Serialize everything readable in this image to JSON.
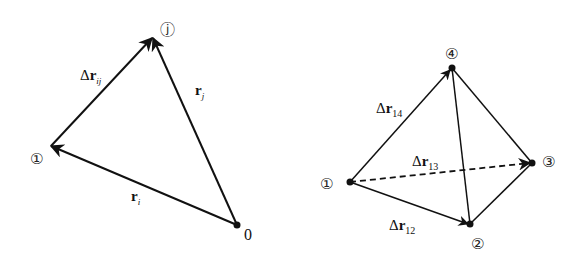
{
  "left_diagram": {
    "nodes": {
      "i": {
        "label": "①",
        "x": 38,
        "y": 163
      },
      "j": {
        "label": "ⓙ",
        "x": 167,
        "y": 34
      },
      "origin": {
        "label": "0",
        "x": 248,
        "y": 238
      }
    },
    "vectors": {
      "r_ij": {
        "prefix": "Δ",
        "main": "r",
        "sub": "ij"
      },
      "r_j": {
        "main": "r",
        "sub": "j"
      },
      "r_i": {
        "main": "r",
        "sub": "i"
      }
    }
  },
  "right_diagram": {
    "nodes": {
      "n1": {
        "label": "①",
        "x": 328,
        "y": 188
      },
      "n2": {
        "label": "②",
        "x": 479,
        "y": 248
      },
      "n3": {
        "label": "③",
        "x": 550,
        "y": 166
      },
      "n4": {
        "label": "④",
        "x": 452,
        "y": 58
      }
    },
    "vectors": {
      "r14": {
        "prefix": "Δ",
        "main": "r",
        "sub": "14"
      },
      "r13": {
        "prefix": "Δ",
        "main": "r",
        "sub": "13"
      },
      "r12": {
        "prefix": "Δ",
        "main": "r",
        "sub": "12"
      }
    }
  },
  "colors": {
    "stroke": "#111111",
    "background": "#ffffff"
  }
}
